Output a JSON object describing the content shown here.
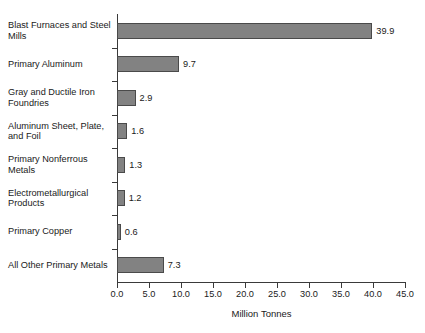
{
  "chart_data": {
    "type": "bar",
    "orientation": "horizontal",
    "title": "s Metal Industries",
    "title_clipped": true,
    "categories": [
      "Blast Furnaces and Steel Mills",
      "Primary Aluminum",
      "Gray and Ductile Iron Foundries",
      "Aluminum Sheet, Plate, and Foil",
      "Primary Nonferrous Metals",
      "Electrometallurgical Products",
      "Primary Copper",
      "All Other Primary Metals"
    ],
    "values": [
      39.9,
      9.7,
      2.9,
      1.6,
      1.3,
      1.2,
      0.6,
      7.3
    ],
    "data_labels": [
      "39.9",
      "9.7",
      "2.9",
      "1.6",
      "1.3",
      "1.2",
      "0.6",
      "7.3"
    ],
    "xlabel": "Million Tonnes",
    "ylabel": "",
    "xlim": [
      0.0,
      45.0
    ],
    "xticks": [
      0.0,
      5.0,
      10.0,
      15.0,
      20.0,
      25.0,
      30.0,
      35.0,
      40.0,
      45.0
    ],
    "xtick_labels": [
      "0.0",
      "5.0",
      "10.0",
      "15.0",
      "20.0",
      "25.0",
      "30.0",
      "35.0",
      "40.0",
      "45.0"
    ],
    "grid": false,
    "legend": null,
    "bar_color": "#828282",
    "bar_border_color": "#4a4a4a",
    "axis_color": "#3a3a3a",
    "background_color": "#ffffff"
  }
}
